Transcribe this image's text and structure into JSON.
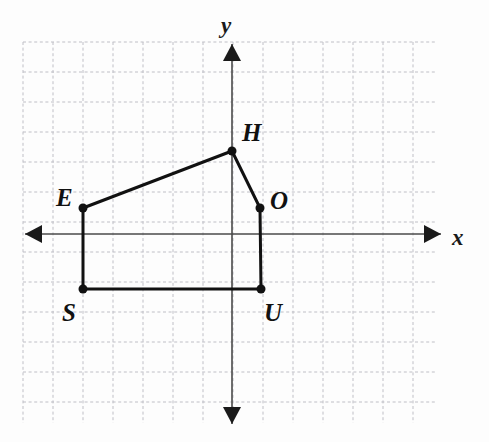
{
  "figure": {
    "kind": "coordinate-plane-polygon",
    "background_color": "#fdfdfd",
    "grid": {
      "visible": true,
      "style": "dashed",
      "color": "#bfbfc6",
      "cell_px": 30,
      "left_px": 23,
      "top_px": 42,
      "right_px": 437,
      "bottom_px": 423,
      "cols": 14,
      "rows": 13
    },
    "axes": {
      "color": "#4a4a4a",
      "origin_px": {
        "x": 232,
        "y": 234
      },
      "x_axis": {
        "label": "x",
        "label_pos_px": {
          "x": 452,
          "y": 226
        },
        "start_px": {
          "x": 25,
          "y": 234
        },
        "end_px": {
          "x": 441,
          "y": 234
        },
        "arrow_left": true,
        "arrow_right": true
      },
      "y_axis": {
        "label": "y",
        "label_pos_px": {
          "x": 221,
          "y": 14
        },
        "start_px": {
          "x": 232,
          "y": 44
        },
        "end_px": {
          "x": 232,
          "y": 424
        },
        "arrow_up": true,
        "arrow_down": true
      }
    },
    "polygon": {
      "name": "HOUSE",
      "stroke_color": "#111111",
      "stroke_width_px": 3,
      "fill": "none",
      "closed": true,
      "vertex_dot_radius_px": 4.5,
      "vertices": [
        {
          "label": "H",
          "px": {
            "x": 232,
            "y": 151
          },
          "grid": {
            "x": 0,
            "y": 2.75
          },
          "label_px": {
            "x": 242,
            "y": 120
          }
        },
        {
          "label": "O",
          "px": {
            "x": 260,
            "y": 208
          },
          "grid": {
            "x": 0.95,
            "y": 0.85
          },
          "label_px": {
            "x": 270,
            "y": 188
          }
        },
        {
          "label": "U",
          "px": {
            "x": 261,
            "y": 289
          },
          "grid": {
            "x": 0.95,
            "y": -1.85
          },
          "label_px": {
            "x": 264,
            "y": 300
          }
        },
        {
          "label": "S",
          "px": {
            "x": 83,
            "y": 289
          },
          "grid": {
            "x": -5,
            "y": -1.85
          },
          "label_px": {
            "x": 62,
            "y": 300
          }
        },
        {
          "label": "E",
          "px": {
            "x": 83,
            "y": 208
          },
          "grid": {
            "x": -5,
            "y": 0.85
          },
          "label_px": {
            "x": 56,
            "y": 185
          }
        }
      ]
    }
  }
}
